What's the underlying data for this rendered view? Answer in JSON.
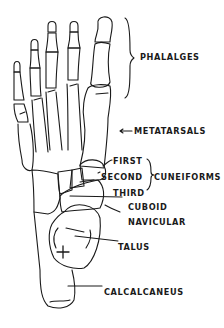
{
  "diagram": {
    "title": "",
    "colors": {
      "line": "#1a1a1a",
      "background": "#ffffff"
    },
    "labels": {
      "phalanges": "PHALALGES",
      "metatarsals": "METATARSALS",
      "metatarsals_arrow": "←",
      "first": "FIRST",
      "second": "SECOND",
      "third": "THIRD",
      "cuneiforms": "CUNEIFORMS",
      "cuboid": "CUBOID",
      "navicular": "NAVICULAR",
      "talus": "TALUS",
      "calcaneus": "CALCALCANEUS"
    }
  }
}
